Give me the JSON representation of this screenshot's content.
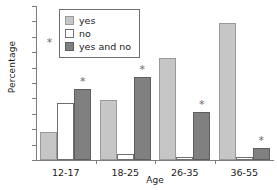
{
  "chart_data": {
    "type": "bar",
    "title": "",
    "xlabel": "Age",
    "ylabel": "Percentage",
    "ylim": [
      0,
      100
    ],
    "yticks": [
      0,
      10,
      20,
      30,
      40,
      50,
      60,
      70,
      80,
      90,
      100
    ],
    "grid": false,
    "legend_position": "top-left",
    "categories": [
      "12-17",
      "18-25",
      "26-35",
      "36-55"
    ],
    "series": [
      {
        "name": "yes",
        "color": "#c6c6c6",
        "values": [
          18,
          39,
          66,
          89
        ]
      },
      {
        "name": "no",
        "color": "#ffffff",
        "values": [
          37,
          4,
          2,
          2
        ]
      },
      {
        "name": "yes and no",
        "color": "#808080",
        "values": [
          46,
          54,
          31,
          8
        ]
      }
    ],
    "annotations": {
      "marker": "*",
      "marker_on_series": "yes and no",
      "marker_categories": [
        "12-17",
        "18-25",
        "26-35",
        "36-55"
      ],
      "legend_marker": "*"
    }
  }
}
